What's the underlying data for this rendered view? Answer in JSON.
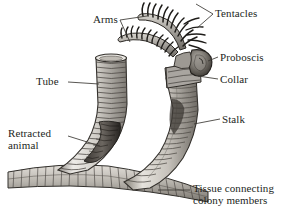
{
  "figure": {
    "background_color": "#ffffff",
    "ink_color": "#231f1c",
    "line_color": "#4a4644"
  },
  "labels": {
    "tentacles": "Tentacles",
    "arms": "Arms",
    "proboscis": "Proboscis",
    "collar": "Collar",
    "stalk": "Stalk",
    "tube": "Tube",
    "retracted_animal": "Retracted\nanimal",
    "tissue_connecting": "Tissue connecting\ncolony members"
  },
  "parts": [
    {
      "id": "tentacles",
      "label": "Tentacles",
      "leader": "forked"
    },
    {
      "id": "arms",
      "label": "Arms",
      "leader": "forked"
    },
    {
      "id": "proboscis",
      "label": "Proboscis",
      "leader": "straight"
    },
    {
      "id": "collar",
      "label": "Collar",
      "leader": "straight"
    },
    {
      "id": "stalk",
      "label": "Stalk",
      "leader": "straight"
    },
    {
      "id": "tube",
      "label": "Tube",
      "leader": "straight"
    },
    {
      "id": "retracted-animal",
      "label": "Retracted animal",
      "leader": "straight"
    },
    {
      "id": "tissue-connecting",
      "label": "Tissue connecting colony members",
      "leader": "straight"
    }
  ]
}
